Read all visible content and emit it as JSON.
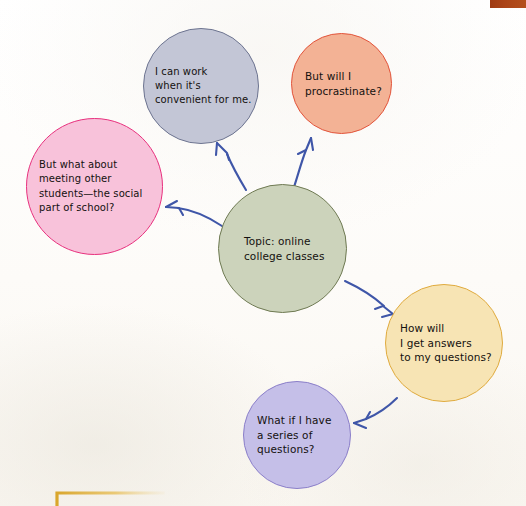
{
  "page": {
    "background_color": "#fdfcfa",
    "decorations": {
      "top_right_bar_color": "#a84116",
      "bottom_left_bracket_color": "#e3b33c"
    }
  },
  "diagram": {
    "type": "mind-map",
    "title": "Topic: online college classes",
    "connector_color": "#3f56a8",
    "center": {
      "id": "topic",
      "text": "Topic: online\ncollege classes",
      "fill": "#ccd3bb",
      "stroke": "#6f7a53"
    },
    "nodes": [
      {
        "id": "work",
        "text": "I can work\nwhen it's\nconvenient for me.",
        "fill": "#c3c6d6",
        "stroke": "#6d7490",
        "from": "topic"
      },
      {
        "id": "procrastinate",
        "text": "But will I\nprocrastinate?",
        "fill": "#f3b295",
        "stroke": "#e2543b",
        "from": "topic"
      },
      {
        "id": "social",
        "text": "But what about\nmeeting other\nstudents—the social\npart of school?",
        "fill": "#f8c2da",
        "stroke": "#e8317e",
        "from": "topic"
      },
      {
        "id": "answers",
        "text": "How will\nI get answers\nto my questions?",
        "fill": "#f7e4b4",
        "stroke": "#e0ab3f",
        "from": "topic"
      },
      {
        "id": "series",
        "text": "What if I have\na series of\nquestions?",
        "fill": "#c5bfe8",
        "stroke": "#8b7fc9",
        "from": "answers"
      }
    ]
  }
}
